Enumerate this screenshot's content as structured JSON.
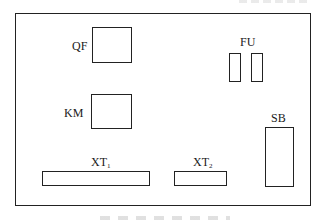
{
  "diagram": {
    "type": "electrical-panel-layout",
    "components": {
      "qf": {
        "label": "QF",
        "description": "circuit breaker"
      },
      "fu": {
        "label": "FU",
        "description": "fuses",
        "count": 2
      },
      "km": {
        "label": "KM",
        "description": "contactor"
      },
      "sb": {
        "label": "SB",
        "description": "push button"
      },
      "xt1": {
        "label": "XT",
        "subscript": "1",
        "description": "terminal block 1"
      },
      "xt2": {
        "label": "XT",
        "subscript": "2",
        "description": "terminal block 2"
      }
    },
    "colors": {
      "line": "#222222",
      "background": "#ffffff"
    }
  }
}
